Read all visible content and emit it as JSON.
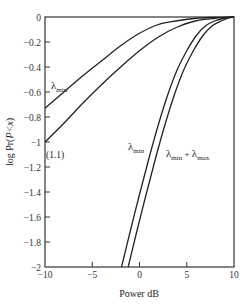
{
  "chart_data": {
    "type": "line",
    "title": "",
    "xlabel": "Power dB",
    "ylabel": "log Pr(P<x)",
    "xlim": [
      -10,
      10
    ],
    "ylim": [
      -2,
      0
    ],
    "x_ticks": [
      "-10",
      "-5",
      "0",
      "5",
      "10"
    ],
    "y_ticks": [
      "0",
      "-0.2",
      "-0.4",
      "-0.6",
      "-0.8",
      "-1",
      "-1.2",
      "-1.4",
      "-1.6",
      "-1.8",
      "-2"
    ],
    "grid": false,
    "legend": "none (inline annotations)",
    "series": [
      {
        "name": "λmin (upper)",
        "x": [
          -10,
          -8,
          -6,
          -4,
          -2,
          0,
          2,
          4,
          6,
          8,
          10
        ],
        "y": [
          -0.73,
          -0.6,
          -0.47,
          -0.35,
          -0.23,
          -0.13,
          -0.06,
          -0.03,
          -0.01,
          -0.003,
          0
        ]
      },
      {
        "name": "(1.1)",
        "x": [
          -10,
          -8,
          -6,
          -4,
          -2,
          0,
          2,
          4,
          6,
          8,
          10
        ],
        "y": [
          -1.0,
          -0.85,
          -0.69,
          -0.54,
          -0.4,
          -0.27,
          -0.16,
          -0.08,
          -0.03,
          -0.01,
          0
        ]
      },
      {
        "name": "λmin (steep)",
        "x": [
          -1.9,
          -1,
          0,
          1,
          2,
          3,
          4,
          5,
          6,
          7,
          8,
          9,
          10
        ],
        "y": [
          -2.0,
          -1.72,
          -1.42,
          -1.13,
          -0.86,
          -0.62,
          -0.42,
          -0.27,
          -0.15,
          -0.07,
          -0.03,
          -0.01,
          0
        ]
      },
      {
        "name": "λmin + λmax",
        "x": [
          -1.2,
          -0.3,
          0.7,
          1.7,
          2.7,
          3.7,
          4.7,
          5.7,
          6.7,
          7.7,
          8.7,
          9.4,
          10
        ],
        "y": [
          -2.0,
          -1.72,
          -1.42,
          -1.13,
          -0.86,
          -0.62,
          -0.42,
          -0.27,
          -0.15,
          -0.07,
          -0.03,
          -0.01,
          0
        ]
      }
    ],
    "annotations": [
      {
        "text": "λmin",
        "x": -9.2,
        "y": -0.56,
        "target": "upper curve"
      },
      {
        "text": "(1.1)",
        "x": -9.8,
        "y": -1.12,
        "target": "second curve"
      },
      {
        "text": "λmin",
        "x": -1.7,
        "y": -1.04,
        "target": "steep curve"
      },
      {
        "text": "λmin + λmax",
        "x": 2.6,
        "y": -1.08,
        "target": "rightmost curve"
      }
    ]
  },
  "labels": {
    "xlabel": "Power dB",
    "ylabel": "log Pr(P<x)",
    "ann_lambda": "λ",
    "ann_min": "min",
    "ann_max": "max",
    "ann_plus": " + ",
    "ann_eq": "(1.1)"
  },
  "colors": {
    "line": "#222222",
    "axis": "#333333",
    "background": "#ffffff"
  }
}
